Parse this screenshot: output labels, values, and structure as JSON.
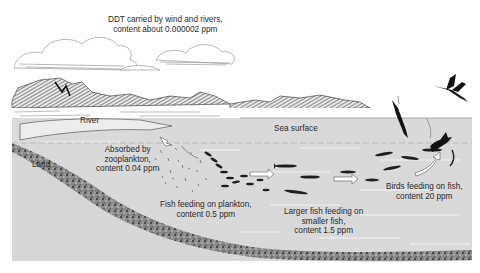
{
  "diagram": {
    "colors": {
      "background": "#ffffff",
      "water": "#d9d9d9",
      "land_fill": "#d6d6d6",
      "sediment": "#6a6a6a",
      "ink": "#1e1e1e",
      "text": "#2a2a2a"
    },
    "labels": {
      "ddt_source": {
        "line1": "DDT carried by wind and rivers,",
        "line2": "content about 0.000002 ppm"
      },
      "river": "River",
      "sea_surface": "Sea surface",
      "land": "Land",
      "zooplankton": {
        "line1": "Absorbed by",
        "line2": "zooplankton,",
        "line3": "content 0.04 ppm"
      },
      "plankton_fish": {
        "line1": "Fish feeding on plankton,",
        "line2": "content 0.5 ppm"
      },
      "larger_fish": {
        "line1": "Larger fish feeding on",
        "line2": "smaller fish,",
        "line3": "content 1.5 ppm"
      },
      "birds": {
        "line1": "Birds feeding on fish,",
        "line2": "content 20 ppm"
      }
    },
    "elements": [
      {
        "name": "clouds",
        "icon": "cloud-icon"
      },
      {
        "name": "mountains",
        "icon": "mountain-icon"
      },
      {
        "name": "river",
        "icon": "river-icon"
      },
      {
        "name": "sea",
        "icon": "water-icon"
      },
      {
        "name": "seabed",
        "icon": "sediment-icon"
      },
      {
        "name": "zooplankton-cloud",
        "icon": "plankton-icon"
      },
      {
        "name": "small-fish-school",
        "icon": "fish-icon"
      },
      {
        "name": "larger-fish",
        "icon": "fish-icon"
      },
      {
        "name": "diving-bird",
        "icon": "bird-icon"
      },
      {
        "name": "flying-bird",
        "icon": "bird-icon"
      },
      {
        "name": "flow-arrows",
        "icon": "arrow-right-icon"
      }
    ]
  }
}
